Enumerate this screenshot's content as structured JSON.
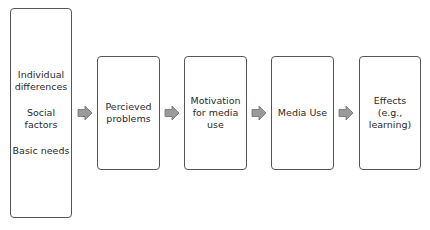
{
  "diagram": {
    "type": "flowchart",
    "direction": "left-to-right",
    "colors": {
      "box_border": "#555555",
      "box_fill": "#ffffff",
      "arrow_fill": "#9a9a9a",
      "arrow_stroke": "#6f6f6f",
      "text": "#2a2a2a"
    },
    "nodes": [
      {
        "id": "antecedents",
        "groups": [
          {
            "lines": [
              "Individual",
              "differences"
            ]
          },
          {
            "lines": [
              "Social",
              "factors"
            ]
          },
          {
            "lines": [
              "Basic needs"
            ]
          }
        ]
      },
      {
        "id": "perceived-problems",
        "lines": [
          "Percieved",
          "problems"
        ]
      },
      {
        "id": "motivation",
        "lines": [
          "Motivation",
          "for media",
          "use"
        ]
      },
      {
        "id": "media-use",
        "lines": [
          "Media Use"
        ]
      },
      {
        "id": "effects",
        "lines": [
          "Effects",
          "(e.g.,",
          "learning)"
        ]
      }
    ],
    "edges": [
      {
        "from": "antecedents",
        "to": "perceived-problems",
        "icon": "block-arrow-right-icon"
      },
      {
        "from": "perceived-problems",
        "to": "motivation",
        "icon": "block-arrow-right-icon"
      },
      {
        "from": "motivation",
        "to": "media-use",
        "icon": "block-arrow-right-icon"
      },
      {
        "from": "media-use",
        "to": "effects",
        "icon": "block-arrow-right-icon"
      }
    ]
  }
}
